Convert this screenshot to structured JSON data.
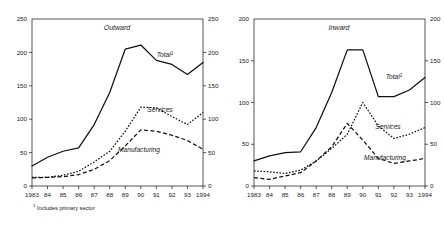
{
  "footnote": {
    "marker": "1",
    "text": " Includes primary sector"
  },
  "series_labels": {
    "total": "Total",
    "total_marker": "1",
    "services": "Services",
    "manufacturing": "Manufacturing"
  },
  "chart_data": [
    {
      "type": "line",
      "title": "Outward",
      "xlabel": "",
      "ylabel": "",
      "xlim": [
        1983,
        1994
      ],
      "ylim": [
        0,
        250
      ],
      "yticks": [
        0,
        50,
        100,
        150,
        200,
        250
      ],
      "ytick_labels": [
        "0",
        "50",
        "100",
        "150",
        "200",
        "250"
      ],
      "right_axis": true,
      "right_ytick_labels": [
        "0",
        "50",
        "100",
        "150",
        "200",
        "250"
      ],
      "grid": false,
      "legend": "inline-annotations",
      "x": [
        1983,
        1984,
        1985,
        1986,
        1987,
        1988,
        1989,
        1990,
        1991,
        1992,
        1993,
        1994
      ],
      "xtick_labels": [
        "1983",
        "84",
        "85",
        "86",
        "87",
        "88",
        "89",
        "90",
        "91",
        "92",
        "93",
        "1994"
      ],
      "series": [
        {
          "name": "Total",
          "style": "solid",
          "values": [
            30,
            43,
            52,
            57,
            92,
            140,
            205,
            211,
            188,
            182,
            167,
            185
          ]
        },
        {
          "name": "Services",
          "style": "dotted",
          "values": [
            13,
            13,
            16,
            22,
            36,
            52,
            82,
            118,
            117,
            104,
            92,
            110
          ]
        },
        {
          "name": "Manufacturing",
          "style": "dashed",
          "values": [
            12,
            13,
            14,
            17,
            25,
            38,
            60,
            84,
            82,
            76,
            68,
            55
          ]
        }
      ]
    },
    {
      "type": "line",
      "title": "Inward",
      "xlabel": "",
      "ylabel": "",
      "xlim": [
        1983,
        1994
      ],
      "ylim": [
        0,
        200
      ],
      "yticks": [
        0,
        50,
        100,
        150,
        200
      ],
      "ytick_labels": [
        "0",
        "50",
        "100",
        "150",
        "200"
      ],
      "right_axis": true,
      "right_ytick_labels": [
        "0",
        "50",
        "100",
        "150",
        "200"
      ],
      "grid": false,
      "legend": "inline-annotations",
      "x": [
        1983,
        1984,
        1985,
        1986,
        1987,
        1988,
        1989,
        1990,
        1991,
        1992,
        1993,
        1994
      ],
      "xtick_labels": [
        "1983",
        "84",
        "85",
        "86",
        "87",
        "88",
        "89",
        "90",
        "91",
        "92",
        "93",
        "1994"
      ],
      "series": [
        {
          "name": "Total",
          "style": "solid",
          "values": [
            30,
            36,
            40,
            41,
            70,
            112,
            163,
            163,
            107,
            107,
            115,
            130
          ]
        },
        {
          "name": "Services",
          "style": "dotted",
          "values": [
            18,
            17,
            15,
            19,
            30,
            45,
            62,
            100,
            72,
            57,
            62,
            70
          ]
        },
        {
          "name": "Manufacturing",
          "style": "dashed",
          "values": [
            10,
            8,
            12,
            16,
            30,
            47,
            75,
            55,
            33,
            27,
            30,
            33
          ]
        }
      ]
    }
  ]
}
